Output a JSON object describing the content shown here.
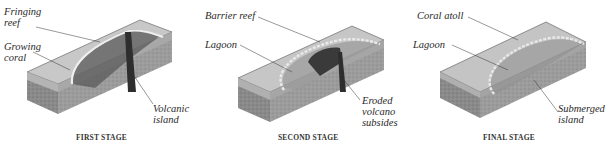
{
  "figure": {
    "panels": [
      {
        "stage": "FIRST STAGE",
        "labels": [
          "Fringing\nreef",
          "Growing\ncoral",
          "Volcanic\nisland"
        ]
      },
      {
        "stage": "SECOND STAGE",
        "labels": [
          "Barrier reef",
          "Lagoon",
          "Eroded\nvolcano\nsubsides"
        ]
      },
      {
        "stage": "FINAL STAGE",
        "labels": [
          "Coral atoll",
          "Lagoon",
          "Submerged\nisland"
        ]
      }
    ]
  }
}
